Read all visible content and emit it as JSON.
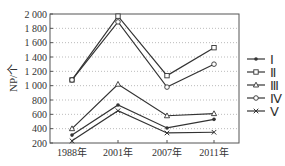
{
  "chart_data": {
    "type": "line",
    "title": "",
    "xlabel": "",
    "ylabel": "NP/个",
    "categories": [
      "1988年",
      "2001年",
      "2007年",
      "2011年"
    ],
    "ylim": [
      200,
      2000
    ],
    "yticks": [
      200,
      400,
      600,
      800,
      1000,
      1200,
      1400,
      1600,
      1800,
      2000
    ],
    "ytick_labels": [
      "200",
      "400",
      "600",
      "800",
      "1 000",
      "1 200",
      "1 400",
      "1 600",
      "1 800",
      "2 000"
    ],
    "grid": "horizontal dotted",
    "legend_position": "right",
    "series": [
      {
        "name": "Ⅰ",
        "marker": "dot",
        "values": [
          310,
          730,
          410,
          530
        ]
      },
      {
        "name": "Ⅱ",
        "marker": "square",
        "values": [
          1080,
          1970,
          1140,
          1530
        ]
      },
      {
        "name": "Ⅲ",
        "marker": "triangle",
        "values": [
          400,
          1020,
          580,
          610
        ]
      },
      {
        "name": "Ⅳ",
        "marker": "circle",
        "values": [
          1080,
          1890,
          980,
          1300
        ]
      },
      {
        "name": "Ⅴ",
        "marker": "x",
        "values": [
          230,
          650,
          340,
          350
        ]
      }
    ]
  },
  "colors": {
    "line": "#333333",
    "grid": "#aaaaaa",
    "axis": "#555555"
  }
}
